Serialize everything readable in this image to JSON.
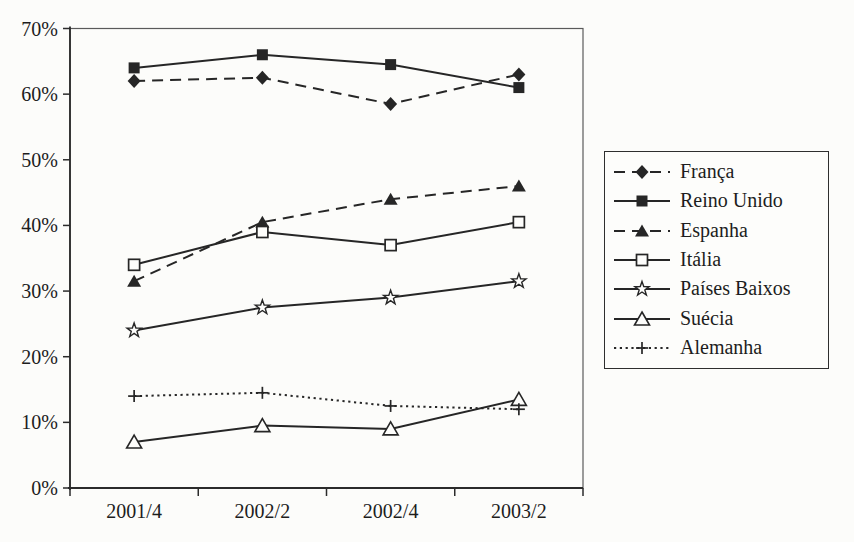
{
  "chart_data": {
    "type": "line",
    "title": "",
    "xlabel": "",
    "ylabel": "",
    "x_categories": [
      "2001/4",
      "2002/2",
      "2002/4",
      "2003/2"
    ],
    "y_axis": {
      "min": 0,
      "max": 70,
      "step": 10,
      "tick_labels": [
        "0%",
        "10%",
        "20%",
        "30%",
        "40%",
        "50%",
        "60%",
        "70%"
      ]
    },
    "grid": false,
    "legend_position": "right",
    "ink_color": "#262626",
    "marker_fill_open": "#fdfdfb",
    "series": [
      {
        "id": "franca",
        "name": "França",
        "line": "dashed",
        "marker": "diamond-filled",
        "values": [
          62,
          62.5,
          58.5,
          63
        ]
      },
      {
        "id": "reino-unido",
        "name": "Reino Unido",
        "line": "solid",
        "marker": "square-filled",
        "values": [
          64,
          66,
          64.5,
          61
        ]
      },
      {
        "id": "espanha",
        "name": "Espanha",
        "line": "dashed",
        "marker": "triangle-filled",
        "values": [
          31.5,
          40.5,
          44,
          46
        ]
      },
      {
        "id": "italia",
        "name": "Itália",
        "line": "solid",
        "marker": "square-open",
        "values": [
          34,
          39,
          37,
          40.5
        ]
      },
      {
        "id": "paises-baixos",
        "name": "Países Baixos",
        "line": "solid",
        "marker": "star-open",
        "values": [
          24,
          27.5,
          29,
          31.5
        ]
      },
      {
        "id": "suecia",
        "name": "Suécia",
        "line": "solid",
        "marker": "triangle-open",
        "values": [
          7,
          9.5,
          9,
          13.5
        ]
      },
      {
        "id": "alemanha",
        "name": "Alemanha",
        "line": "dotted",
        "marker": "plus",
        "values": [
          14,
          14.5,
          12.5,
          12
        ]
      }
    ]
  }
}
